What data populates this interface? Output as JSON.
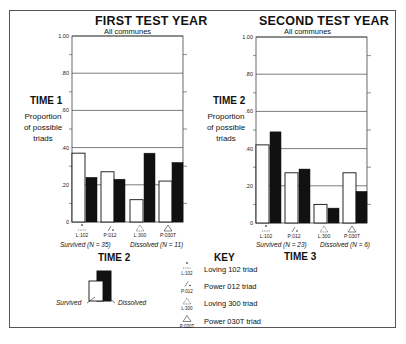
{
  "chart_data": [
    {
      "type": "bar",
      "title": "FIRST TEST YEAR",
      "subtitle": "All communes",
      "ylabel_title": "TIME 1",
      "ylabel": "Proportion of possible triads",
      "xlabel": "TIME 2",
      "ylim": [
        0,
        1.0
      ],
      "yticks": [
        "0",
        ".20",
        ".40",
        ".60",
        ".80",
        "1.00"
      ],
      "categories": [
        "L:102",
        "P:012",
        "L:300",
        "P:030T"
      ],
      "groups": [
        "Survived (N = 35)",
        "Dissolved (N = 11)"
      ],
      "series": [
        {
          "name": "Survived",
          "color": "#ffffff",
          "values": [
            0.37,
            0.27,
            0.12,
            0.22
          ]
        },
        {
          "name": "Dissolved",
          "color": "#111111",
          "values": [
            0.24,
            0.23,
            0.37,
            0.32
          ]
        }
      ],
      "grid": true
    },
    {
      "type": "bar",
      "title": "SECOND TEST YEAR",
      "subtitle": "All communes",
      "ylabel_title": "TIME 2",
      "ylabel": "Proportion of possible triads",
      "xlabel": "TIME 3",
      "ylim": [
        0,
        1.0
      ],
      "yticks": [
        "0",
        ".20",
        ".40",
        ".60",
        ".80",
        "1.00"
      ],
      "categories": [
        "L:102",
        "P:012",
        "L:300",
        "P:030T"
      ],
      "groups": [
        "Survived (N = 23)",
        "Dissolved (N = 6)"
      ],
      "series": [
        {
          "name": "Survived",
          "color": "#ffffff",
          "values": [
            0.42,
            0.27,
            0.1,
            0.27
          ]
        },
        {
          "name": "Dissolved",
          "color": "#111111",
          "values": [
            0.49,
            0.29,
            0.08,
            0.17
          ]
        }
      ],
      "grid": true
    }
  ],
  "legend": {
    "sample_survived": "Survived",
    "sample_dissolved": "Dissolved"
  },
  "key": {
    "title": "KEY",
    "items": [
      {
        "abbr": "L:102",
        "label": "Loving 102 triad"
      },
      {
        "abbr": "P:012",
        "label": "Power 012 triad"
      },
      {
        "abbr": "L:300",
        "label": "Loving 300 triad"
      },
      {
        "abbr": "P:030T",
        "label": "Power 030T triad"
      }
    ]
  }
}
